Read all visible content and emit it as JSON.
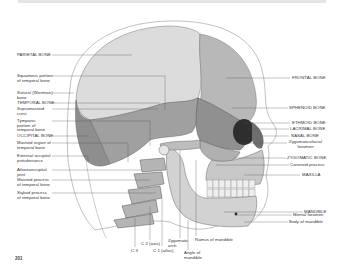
{
  "figure": {
    "page_number": "201"
  },
  "labels_left": [
    {
      "id": "parietal",
      "text": "PARIETAL BONE"
    },
    {
      "id": "squamous",
      "text": "Squamous portion\nof temporal bone"
    },
    {
      "id": "sutural",
      "text": "Sutural (Wormian)\nbone"
    },
    {
      "id": "temporal",
      "text": "TEMPORAL BONE"
    },
    {
      "id": "supramastoid",
      "text": "Supramastoid\ncrest"
    },
    {
      "id": "tympanic",
      "text": "Tympanic\nportion of\ntemporal bone"
    },
    {
      "id": "occipital",
      "text": "OCCIPITAL BONE"
    },
    {
      "id": "mastoid-region",
      "text": "Mastoid region of\ntemporal bone"
    },
    {
      "id": "ext-occipital",
      "text": "External occipital\nprotuberance"
    },
    {
      "id": "atlantooccipital",
      "text": "Atlantooccipital\njoint"
    },
    {
      "id": "mastoid-process",
      "text": "Mastoid process\nof temporal bone"
    },
    {
      "id": "styloid",
      "text": "Styloid process\nof temporal bone"
    }
  ],
  "labels_right": [
    {
      "id": "frontal",
      "text": "FRONTAL BONE"
    },
    {
      "id": "sphenoid",
      "text": "SPHENOID BONE"
    },
    {
      "id": "ethmoid",
      "text": "ETHMOID BONE"
    },
    {
      "id": "lacrimal",
      "text": "LACRIMAL BONE"
    },
    {
      "id": "nasal",
      "text": "NASAL BONE"
    },
    {
      "id": "zygomaticofacial",
      "text": "Zygomaticofacial\nforamen"
    },
    {
      "id": "zygomatic",
      "text": "ZYGOMATIC BONE"
    },
    {
      "id": "coronoid",
      "text": "Coronoid process"
    },
    {
      "id": "maxilla",
      "text": "MAXILLA"
    },
    {
      "id": "mandible",
      "text": "MANDIBLE"
    },
    {
      "id": "mental-foramen",
      "text": "Mental foramen"
    },
    {
      "id": "body-mandible",
      "text": "Body of mandible"
    }
  ],
  "labels_bottom": [
    {
      "id": "c3",
      "text": "C 3"
    },
    {
      "id": "c2",
      "text": "C 2 (axis)"
    },
    {
      "id": "c1",
      "text": "C 1 (atlas)"
    },
    {
      "id": "zyg-arch",
      "text": "Zygomatic\narch"
    },
    {
      "id": "ramus",
      "text": "Ramus of mandible"
    },
    {
      "id": "angle",
      "text": "Angle of\nmandible"
    }
  ],
  "colors": {
    "parietal": "#d6d6d6",
    "temporal": "#9a9a9a",
    "occipital": "#8c8c8c",
    "frontal": "#b5b5b5",
    "face": "#c4c4c4",
    "mandible": "#cfcfcf",
    "leader_line": "#555555",
    "outline": "#888888"
  }
}
